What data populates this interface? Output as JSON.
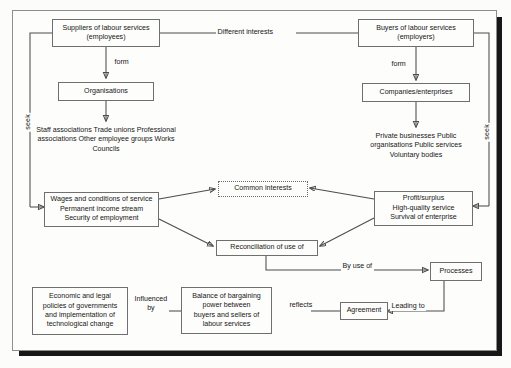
{
  "figure": {
    "style": {
      "frame_border": "#8e8e8e",
      "shadow": "#17171a",
      "line": "#4c4c4c",
      "page": "#fdfdfc"
    }
  },
  "nodes": {
    "suppliers": {
      "name": "suppliers-box",
      "lines": [
        "Suppliers of labour services",
        "(employees)"
      ]
    },
    "organisations": {
      "name": "organisations-box",
      "lines": [
        "Organisations"
      ]
    },
    "employee_orgs": {
      "name": "employee-organisation-list",
      "lines": [
        "Staff associations",
        "Trade unions",
        "Professional associations",
        "Other employee groups",
        "Works Councils"
      ]
    },
    "buyers": {
      "name": "buyers-box",
      "lines": [
        "Buyers of labour services",
        "(employers)"
      ]
    },
    "companies": {
      "name": "companies-box",
      "lines": [
        "Companies/enterprises"
      ]
    },
    "employer_orgs": {
      "name": "employer-organisation-list",
      "lines": [
        "Private businesses",
        "Public organisations",
        "Public services",
        "Voluntary bodies"
      ]
    },
    "employee_goals": {
      "name": "employee-goals-box",
      "lines": [
        "Wages and conditions of service",
        "Permanent income stream",
        "Security of employment"
      ]
    },
    "employer_goals": {
      "name": "employer-goals-box",
      "lines": [
        "Profit/surplus",
        "High-quality service",
        "Survival of enterprise"
      ]
    },
    "common": {
      "name": "common-interests-box",
      "lines": [
        "Common interests"
      ]
    },
    "reconciliation": {
      "name": "reconciliation-box",
      "lines": [
        "Reconciliation of use of"
      ]
    },
    "processes": {
      "name": "processes-box",
      "lines": [
        "Processes"
      ]
    },
    "agreement": {
      "name": "agreement-box",
      "lines": [
        "Agreement"
      ]
    },
    "balance": {
      "name": "balance-of-bargaining-power-box",
      "lines": [
        "Balance of bargaining",
        "power between",
        "buyers and sellers of",
        "labour services"
      ]
    },
    "policies": {
      "name": "economic-legal-policies-box",
      "lines": [
        "Economic and legal",
        "policies of governments",
        "and implementation of",
        "technological change"
      ]
    }
  },
  "edge_labels": {
    "different_interests": "Different interests",
    "form_left": "form",
    "form_right": "form",
    "seek_left": "seek",
    "seek_right": "seek",
    "by_use_of": "By use of",
    "leading_to": "Leading to",
    "reflects": "reflects",
    "influenced_by_line1": "Influenced",
    "influenced_by_line2": "by"
  }
}
